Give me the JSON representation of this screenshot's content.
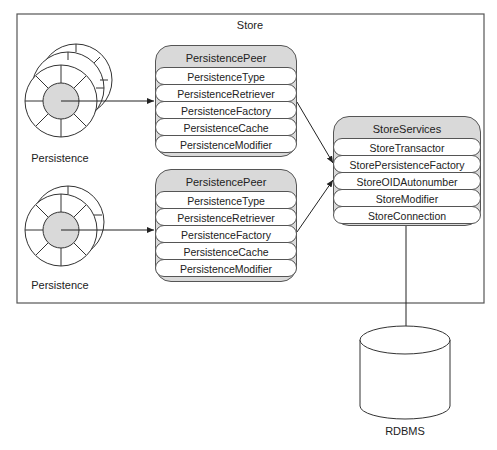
{
  "store": {
    "label": "Store"
  },
  "persistence": [
    {
      "label": "Persistence"
    },
    {
      "label": "Persistence"
    }
  ],
  "peers": [
    {
      "title": "PersistencePeer",
      "items": [
        "PersistenceType",
        "PersistenceRetriever",
        "PersistenceFactory",
        "PersistenceCache",
        "PersistenceModifier"
      ]
    },
    {
      "title": "PersistencePeer",
      "items": [
        "PersistenceType",
        "PersistenceRetriever",
        "PersistenceFactory",
        "PersistenceCache",
        "PersistenceModifier"
      ]
    }
  ],
  "services": {
    "title": "StoreServices",
    "items": [
      "StoreTransactor",
      "StorePersistenceFactory",
      "StoreOIDAutonumber",
      "StoreModifier",
      "StoreConnection"
    ]
  },
  "database": {
    "label": "RDBMS"
  },
  "colors": {
    "box_fill": "#d9d9d9",
    "stroke": "#555555",
    "hub_fill": "#d9d9d9"
  }
}
